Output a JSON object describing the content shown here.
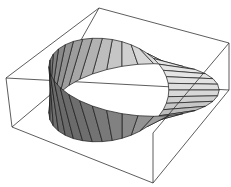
{
  "figure": {
    "width": 231,
    "height": 187,
    "colors": {
      "background": "#ffffff",
      "edge": "#1a1a1a",
      "box": "#333333",
      "face_light": "#e6e6e6",
      "face_dark": "#6a6a6a"
    },
    "box": {
      "top": [
        99,
        8
      ],
      "left": [
        6,
        78
      ],
      "right": [
        229,
        43
      ],
      "front_top": [
        153,
        133
      ],
      "left_bottom": [
        12,
        127
      ],
      "right_bottom": [
        229,
        90
      ],
      "bottom": [
        153,
        183
      ],
      "back_bottom": [
        50,
        95
      ]
    },
    "strip": {
      "center": [
        122,
        90
      ],
      "radius_x": 72,
      "radius_y": 36,
      "half_width": 30,
      "segments": 36
    }
  }
}
